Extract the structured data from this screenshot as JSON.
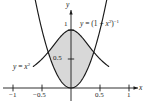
{
  "figure": {
    "title": "",
    "background_color": "#ffffff",
    "width": 148,
    "height": 104
  },
  "axes": {
    "x_axis_name": "x",
    "y_axis_name": "y",
    "x_ticks": [
      {
        "value": -1,
        "label": "−1"
      },
      {
        "value": -0.5,
        "label": "−0.5"
      },
      {
        "value": 0.5,
        "label": "0.5"
      },
      {
        "value": 1,
        "label": "1"
      }
    ],
    "y_ticks": [
      {
        "value": 0.5,
        "label": "0.5"
      },
      {
        "value": 1,
        "label": "1"
      }
    ],
    "axis_color": "#1a1a1a"
  },
  "curve_labels": {
    "bell": {
      "lhs": "y",
      "eq": " = (1 + ",
      "base": "x",
      "base_exp": "2",
      "close": ")",
      "outer_exp": "−1"
    },
    "parabola": {
      "lhs": "y",
      "eq": " = ",
      "base": "x",
      "exp": "2"
    }
  },
  "colors": {
    "shaded_region": "#d8d8d8",
    "curve": "#1a1a1a",
    "text": "#1a1a1a"
  },
  "chart_data": {
    "type": "line",
    "title": "",
    "xlabel": "x",
    "ylabel": "y",
    "xlim": [
      -1.2,
      1.25
    ],
    "ylim": [
      -0.12,
      1.3
    ],
    "grid": false,
    "legend": "none",
    "shaded_between": {
      "upper_series": "y = (1 + x^2)^-1",
      "lower_series": "y = x^2",
      "x_from": -0.7862,
      "x_to": 0.7862,
      "fill_color": "#d8d8d8"
    },
    "annotations": [
      {
        "text": "y = (1 + x^2)^-1",
        "x": 0.32,
        "y": 1.03
      },
      {
        "text": "y = x^2",
        "x": -0.95,
        "y": 0.43
      }
    ],
    "intersections": [
      {
        "x": -0.7862,
        "y": 0.6181
      },
      {
        "x": 0.7862,
        "y": 0.6181
      }
    ],
    "series": [
      {
        "name": "y = (1 + x^2)^-1",
        "formula": "y = (1 + x^2)^(-1)",
        "x": [
          -1.2,
          -1.1,
          -1.0,
          -0.9,
          -0.8,
          -0.7,
          -0.6,
          -0.5,
          -0.4,
          -0.3,
          -0.2,
          -0.1,
          0.0,
          0.1,
          0.2,
          0.3,
          0.4,
          0.5,
          0.6,
          0.7,
          0.8,
          0.9,
          1.0,
          1.1,
          1.2
        ],
        "values": [
          0.4098,
          0.4525,
          0.5,
          0.5525,
          0.6098,
          0.6711,
          0.7353,
          0.8,
          0.8621,
          0.9174,
          0.9615,
          0.9901,
          1.0,
          0.9901,
          0.9615,
          0.9174,
          0.8621,
          0.8,
          0.7353,
          0.6711,
          0.6098,
          0.5525,
          0.5,
          0.4525,
          0.4098
        ]
      },
      {
        "name": "y = x^2",
        "formula": "y = x^2",
        "x": [
          -1.2,
          -1.1,
          -1.0,
          -0.9,
          -0.8,
          -0.7,
          -0.6,
          -0.5,
          -0.4,
          -0.3,
          -0.2,
          -0.1,
          0.0,
          0.1,
          0.2,
          0.3,
          0.4,
          0.5,
          0.6,
          0.7,
          0.8,
          0.9,
          1.0,
          1.1,
          1.2
        ],
        "values": [
          1.44,
          1.21,
          1.0,
          0.81,
          0.64,
          0.49,
          0.36,
          0.25,
          0.16,
          0.09,
          0.04,
          0.01,
          0.0,
          0.01,
          0.04,
          0.09,
          0.16,
          0.25,
          0.36,
          0.49,
          0.64,
          0.81,
          1.0,
          1.21,
          1.44
        ]
      }
    ]
  }
}
